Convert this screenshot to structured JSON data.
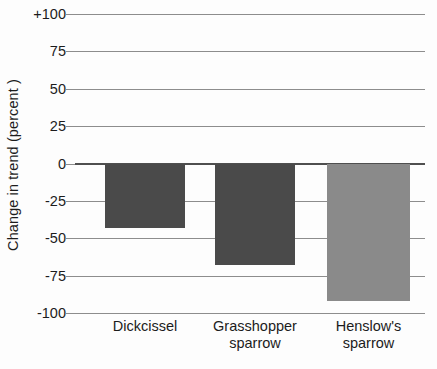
{
  "chart_data": {
    "type": "bar",
    "title": "",
    "xlabel": "",
    "ylabel": "Change in trend (percent )",
    "categories": [
      "Dickcissel",
      "Grasshopper sparrow",
      "Henslow's sparrow"
    ],
    "category_lines": [
      [
        "Dickcissel"
      ],
      [
        "Grasshopper",
        "sparrow"
      ],
      [
        "Henslow's",
        "sparrow"
      ]
    ],
    "values": [
      -43,
      -68,
      -92
    ],
    "ylim": [
      -100,
      100
    ],
    "yticks": [
      100,
      75,
      50,
      25,
      0,
      -25,
      -50,
      -75,
      -100
    ],
    "ytick_labels": [
      "+100",
      "75",
      "50",
      "25",
      "0",
      "-25",
      "-50",
      "-75",
      "-100"
    ],
    "bar_colors": [
      "#4a4a4a",
      "#4a4a4a",
      "#8a8a8a"
    ],
    "grid": true,
    "legend": "none",
    "zero_line": 0
  },
  "axis": {
    "y_title": "Change in trend (percent )"
  },
  "colors": {
    "bar_dark": "#4a4a4a",
    "bar_light": "#8a8a8a",
    "gridline": "#8d8d8d",
    "zero_line": "#4f4f4f",
    "text": "#1c1c1c",
    "background": "#fdfdfd"
  }
}
